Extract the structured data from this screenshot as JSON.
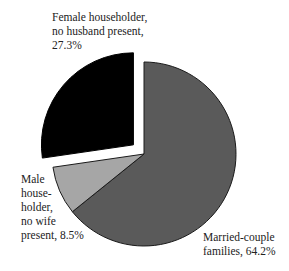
{
  "chart_data": {
    "type": "pie",
    "title": "",
    "slices": [
      {
        "label": "Married-couple families",
        "value": 64.2,
        "color": "#5a5a5a",
        "exploded": false
      },
      {
        "label": "Male householder, no wife present",
        "value": 8.5,
        "color": "#a6a6a6",
        "exploded": false
      },
      {
        "label": "Female householder, no husband present",
        "value": 27.3,
        "color": "#000000",
        "exploded": true
      }
    ],
    "legend": "none",
    "start_angle": "12 o'clock, clockwise"
  },
  "labels": {
    "female": "Female householder,\nno husband present,\n27.3%",
    "male": "Male\nhouse-\nholder,\nno wife\npresent, 8.5%",
    "married": "Married-couple\nfamilies, 64.2%"
  }
}
